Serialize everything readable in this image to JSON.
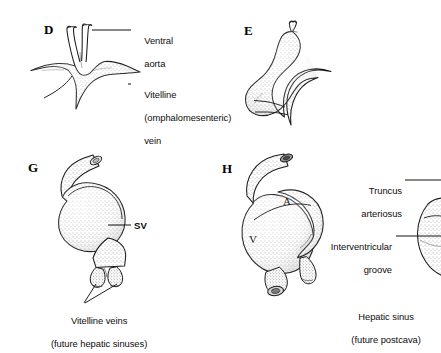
{
  "figure": {
    "type": "embryology-diagram",
    "background_color": "#ffffff",
    "ink_color": "#111111"
  },
  "panels": [
    {
      "id": "D",
      "letter": "D",
      "description": "Y-shaped paired vessel, ventral aorta above and vitelline vein roots below"
    },
    {
      "id": "E",
      "letter": "E",
      "description": "S-shaped looping heart tube with bifid cranial end"
    },
    {
      "id": "G",
      "letter": "G",
      "description": "Looped heart with prominent sinus venosus receiving two vitelline veins"
    },
    {
      "id": "H",
      "letter": "H",
      "description": "Further looped heart showing atrium and ventricle with interventricular groove"
    }
  ],
  "labels": [
    {
      "id": "ventral-aorta",
      "panel": "D",
      "lines": [
        "Ventral",
        "aorta"
      ],
      "align": "left"
    },
    {
      "id": "vitelline-vein",
      "panel": "D",
      "lines": [
        "Vitelline",
        "(omphalomesenteric)",
        "vein"
      ],
      "align": "left"
    },
    {
      "id": "sv",
      "panel": "G",
      "lines": [
        "SV"
      ],
      "align": "left"
    },
    {
      "id": "vitelline-veins-hepatic",
      "panel": "G",
      "lines": [
        "Vitelline veins",
        "(future hepatic sinuses)"
      ],
      "align": "center"
    },
    {
      "id": "truncus-arteriosus",
      "panel": "right",
      "lines": [
        "Truncus",
        "arteriosus"
      ],
      "align": "right"
    },
    {
      "id": "interventricular-groove",
      "panel": "right",
      "lines": [
        "Interventricular",
        "groove"
      ],
      "align": "right"
    },
    {
      "id": "hepatic-sinus-postcava",
      "panel": "right",
      "lines": [
        "Hepatic sinus",
        "(future postcava)"
      ],
      "align": "center"
    }
  ],
  "inner_labels": [
    {
      "id": "atrium",
      "panel": "H",
      "text": "A"
    },
    {
      "id": "ventricle",
      "panel": "H",
      "text": "V"
    }
  ],
  "text": {
    "panel_d_letter": "D",
    "panel_e_letter": "E",
    "panel_g_letter": "G",
    "panel_h_letter": "H",
    "ventral_aorta_l1": "Ventral",
    "ventral_aorta_l2": "aorta",
    "vitelline_l1": "Vitelline",
    "vitelline_l2": "(omphalomesenteric)",
    "vitelline_l3": "vein",
    "sv": "SV",
    "vitelline_veins_l1": "Vitelline veins",
    "vitelline_veins_l2": "(future hepatic sinuses)",
    "truncus_l1": "Truncus",
    "truncus_l2": "arteriosus",
    "interventricular_l1": "Interventricular",
    "interventricular_l2": "groove",
    "hepatic_sinus_l1": "Hepatic sinus",
    "hepatic_sinus_l2": "(future postcava)",
    "atrium": "A",
    "ventricle": "V"
  }
}
